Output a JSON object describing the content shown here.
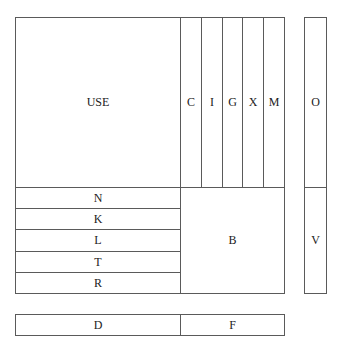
{
  "diagram": {
    "line_color": "#5a5a5a",
    "main_block": {
      "use": {
        "label": "USE"
      },
      "columns": [
        {
          "label": "C"
        },
        {
          "label": "I"
        },
        {
          "label": "G"
        },
        {
          "label": "X"
        },
        {
          "label": "M"
        }
      ],
      "rows": [
        {
          "label": "N"
        },
        {
          "label": "K"
        },
        {
          "label": "L"
        },
        {
          "label": "T"
        },
        {
          "label": "R"
        }
      ],
      "b": {
        "label": "B"
      }
    },
    "side_column": {
      "top": {
        "label": "O"
      },
      "bottom": {
        "label": "V"
      }
    },
    "bottom_bar": {
      "left": {
        "label": "D"
      },
      "right": {
        "label": "F"
      }
    }
  }
}
